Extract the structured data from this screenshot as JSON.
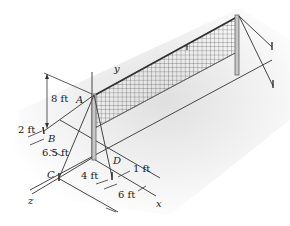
{
  "figure": {
    "points": {
      "A": "A",
      "B": "B",
      "C": "C",
      "D": "D"
    },
    "axes": {
      "x": "x",
      "y": "y",
      "z": "z"
    },
    "dimensions": {
      "height_A": "8 ft",
      "B_offset": "2 ft",
      "B_to_C": "6.5 ft",
      "C_to_D": "4 ft",
      "D_offset": "1 ft",
      "x_span": "6 ft"
    },
    "colors": {
      "background": "#ffffff",
      "shadow": "#e6e6e6",
      "line": "#333333",
      "net": "#555555",
      "post": "#9a9a9a"
    }
  }
}
